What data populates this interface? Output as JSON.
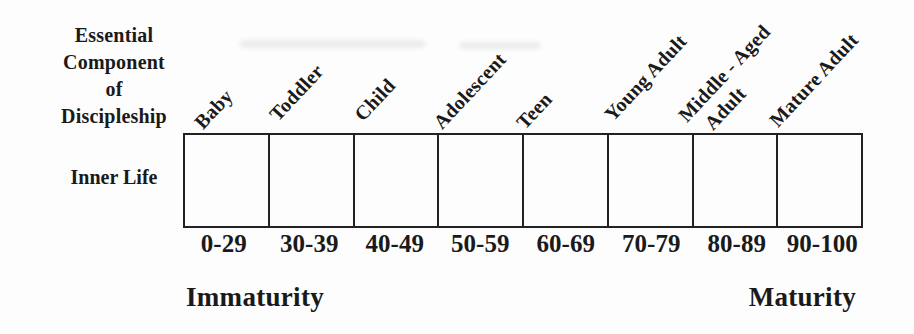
{
  "header": {
    "title_lines": [
      "Essential",
      "Component",
      "of",
      "Discipleship"
    ]
  },
  "row": {
    "label": "Inner Life"
  },
  "stages": [
    {
      "label": "Baby",
      "range": "0-29"
    },
    {
      "label": "Toddler",
      "range": "30-39"
    },
    {
      "label": "Child",
      "range": "40-49"
    },
    {
      "label": "Adolescent",
      "range": "50-59"
    },
    {
      "label": "Teen",
      "range": "60-69"
    },
    {
      "label": "Young Adult",
      "range": "70-79"
    },
    {
      "label": "Middle - Aged Adult",
      "label_lines": [
        "Middle - Aged",
        "Adult"
      ],
      "range": "80-89"
    },
    {
      "label": "Mature Adult",
      "range": "90-100"
    }
  ],
  "axis": {
    "left": "Immaturity",
    "right": "Maturity"
  },
  "colors": {
    "ink": "#1a1a1a",
    "border": "#222222",
    "background": "#fdfdfd"
  }
}
